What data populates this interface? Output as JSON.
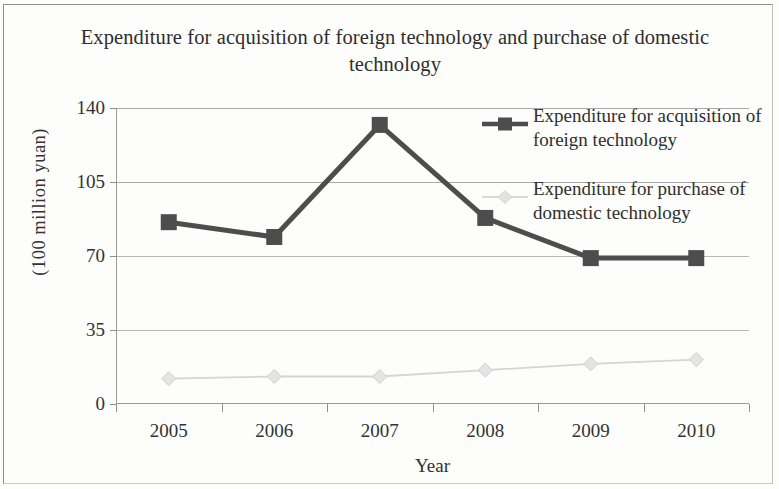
{
  "chart_data": {
    "type": "line",
    "title": "Expenditure for acquisition of foreign technology and purchase of domestic technology",
    "xlabel": "Year",
    "ylabel": "(100 million yuan)",
    "categories": [
      "2005",
      "2006",
      "2007",
      "2008",
      "2009",
      "2010"
    ],
    "ylim": [
      0,
      140
    ],
    "yticks": [
      0,
      35,
      70,
      105,
      140
    ],
    "ytick_labels": [
      "0",
      "35",
      "70",
      "105",
      "140"
    ],
    "grid": true,
    "legend_position": "upper right",
    "series": [
      {
        "name": "Expenditure for acquisition of foreign technology",
        "values": [
          86,
          79,
          132,
          88,
          69,
          69
        ],
        "color": "#4d4d4d",
        "marker": "square"
      },
      {
        "name": "Expenditure for purchase of domestic technology",
        "values": [
          12,
          13,
          13,
          16,
          19,
          21
        ],
        "color": "#d5d5d5",
        "marker": "diamond"
      }
    ]
  },
  "legend": {
    "entries": [
      {
        "label": "Expenditure for acquisition of foreign technology"
      },
      {
        "label": "Expenditure for purchase of domestic technology"
      }
    ]
  },
  "colors": {
    "foreign_series": "#4d4d4d",
    "domestic_series": "#d5d5d5",
    "axis": "#9a9a9a",
    "grid": "#a9a9a9",
    "text": "#2e2e2e",
    "background": "#fdfdfc"
  }
}
